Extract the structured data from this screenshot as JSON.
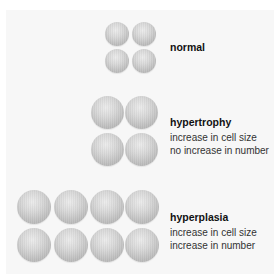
{
  "diagram": {
    "sections": [
      {
        "title": "normal",
        "lines": []
      },
      {
        "title": "hypertrophy",
        "lines": [
          "increase in cell size",
          "no increase in number"
        ]
      },
      {
        "title": "hyperplasia",
        "lines": [
          "increase in cell size",
          "increase in number"
        ]
      }
    ],
    "colors": {
      "cell": "#c8c8c8",
      "background": "#f7f7f7",
      "text": "#111111"
    }
  }
}
